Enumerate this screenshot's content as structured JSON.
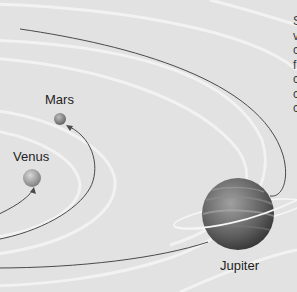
{
  "diagram": {
    "planets": [
      {
        "name": "Mars",
        "label": "Mars"
      },
      {
        "name": "Venus",
        "label": "Venus"
      },
      {
        "name": "Jupiter",
        "label": "Jupiter"
      }
    ],
    "side_text_fragments": [
      "S",
      "v",
      "c",
      "f",
      "c",
      "c",
      "c"
    ]
  },
  "colors": {
    "background": "#e2e2e2",
    "orbit_line": "#4a4a4a",
    "orbit_band": "#f2f2f2",
    "planet_mars": "#8a8a8a",
    "planet_venus": "#a8a8a8",
    "planet_jupiter": "#5a5a5a"
  }
}
